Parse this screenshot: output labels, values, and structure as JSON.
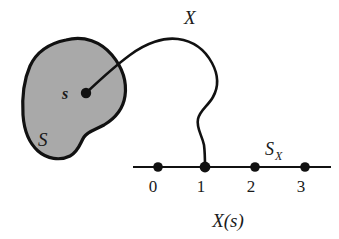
{
  "figure": {
    "background_color": "#ffffff",
    "ink_color": "#111111",
    "blob_fill_color": "#a9a9a9"
  },
  "sample_space": {
    "set_label": "S",
    "point_label": "s",
    "point_dot_name": "sample-point-dot"
  },
  "mapping": {
    "label": "X",
    "curve_name": "mapping-curve"
  },
  "range_space": {
    "label_base": "S",
    "label_subscript": "X",
    "axis_name": "real-number-line",
    "value_label": "X(s)",
    "ticks": [
      {
        "label": "0",
        "x": 158,
        "value": 0
      },
      {
        "label": "1",
        "x": 205,
        "value": 1
      },
      {
        "label": "2",
        "x": 255,
        "value": 2
      },
      {
        "label": "3",
        "x": 305,
        "value": 3
      }
    ],
    "mapped_tick_index": 1
  }
}
